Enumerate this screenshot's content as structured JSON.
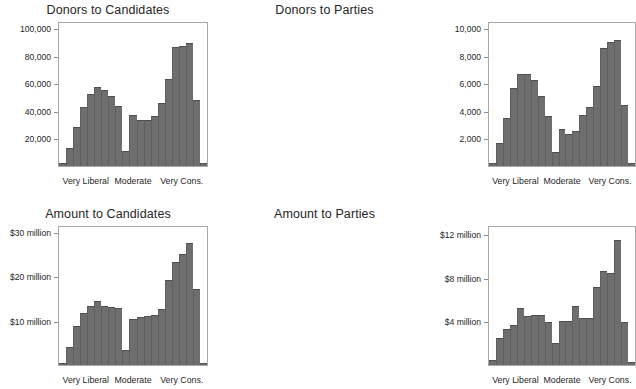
{
  "figure": {
    "panel_count": 4,
    "bar_color": "#6e6e6e",
    "frame_color": "#a8a8a8",
    "background": "#ffffff"
  },
  "x_axis_labels": {
    "left": "Very Liberal",
    "center": "Moderate",
    "right": "Very Cons."
  },
  "chart_data": [
    {
      "id": "donors-to-candidates",
      "type": "bar",
      "title": "Donors to Candidates",
      "xlabel": "",
      "ylabel": "",
      "grid": false,
      "legend": false,
      "ylim": [
        0,
        105000
      ],
      "yticks": [
        20000,
        40000,
        60000,
        80000,
        100000
      ],
      "ytick_labels": [
        "20,000",
        "40,000",
        "60,000",
        "80,000",
        "100,000"
      ],
      "xtick_labels": [
        "Very Liberal",
        "Moderate",
        "Very Cons."
      ],
      "categories": [
        "1",
        "2",
        "3",
        "4",
        "5",
        "6",
        "7",
        "8",
        "9",
        "10",
        "11",
        "12",
        "13",
        "14",
        "15",
        "16",
        "17",
        "18",
        "19",
        "20",
        "21"
      ],
      "values": [
        2000,
        13000,
        28000,
        42500,
        52000,
        57000,
        55000,
        50500,
        43500,
        11000,
        37000,
        33500,
        33500,
        36000,
        45500,
        63000,
        86000,
        87000,
        89000,
        47500,
        2000
      ]
    },
    {
      "id": "donors-to-parties",
      "type": "bar",
      "title": "Donors to Parties",
      "xlabel": "",
      "ylabel": "",
      "grid": false,
      "legend": false,
      "ylim": [
        0,
        10500
      ],
      "yticks": [
        2000,
        4000,
        6000,
        8000,
        10000
      ],
      "ytick_labels": [
        "2,000",
        "4,000",
        "6,000",
        "8,000",
        "10,000"
      ],
      "xtick_labels": [
        "Very Liberal",
        "Moderate",
        "Very Cons."
      ],
      "categories": [
        "1",
        "2",
        "3",
        "4",
        "5",
        "6",
        "7",
        "8",
        "9",
        "10",
        "11",
        "12",
        "13",
        "14",
        "15",
        "16",
        "17",
        "18",
        "19",
        "20",
        "21"
      ],
      "values": [
        250,
        1650,
        3500,
        5650,
        6650,
        6650,
        6250,
        5050,
        3650,
        1000,
        2650,
        2350,
        2500,
        3700,
        4250,
        5800,
        8550,
        8950,
        9100,
        4450,
        250
      ]
    },
    {
      "id": "amount-to-candidates",
      "type": "bar",
      "title": "Amount to Candidates",
      "xlabel": "",
      "ylabel": "",
      "grid": false,
      "legend": false,
      "ylim": [
        0,
        31500
      ],
      "yticks": [
        10000,
        20000,
        30000
      ],
      "ytick_labels": [
        "$10 million",
        "$20 million",
        "$30 million"
      ],
      "xtick_labels": [
        "Very Liberal",
        "Moderate",
        "Very Cons."
      ],
      "categories": [
        "1",
        "2",
        "3",
        "4",
        "5",
        "6",
        "7",
        "8",
        "9",
        "10",
        "11",
        "12",
        "13",
        "14",
        "15",
        "16",
        "17",
        "18",
        "19",
        "20",
        "21"
      ],
      "values": [
        500,
        4000,
        8700,
        11700,
        13200,
        14400,
        13200,
        13000,
        12800,
        3300,
        10400,
        10800,
        11000,
        11200,
        12500,
        19200,
        23100,
        25000,
        27500,
        17200,
        500
      ]
    },
    {
      "id": "amount-to-parties",
      "type": "bar",
      "title": "Amount to Parties",
      "xlabel": "",
      "ylabel": "",
      "grid": false,
      "legend": false,
      "ylim": [
        0,
        12800
      ],
      "yticks": [
        4000,
        8000,
        12000
      ],
      "ytick_labels": [
        "$4 million",
        "$8 million",
        "$12 million"
      ],
      "xtick_labels": [
        "Very Liberal",
        "Moderate",
        "Very Cons."
      ],
      "categories": [
        "1",
        "2",
        "3",
        "4",
        "5",
        "6",
        "7",
        "8",
        "9",
        "10",
        "11",
        "12",
        "13",
        "14",
        "15",
        "16",
        "17",
        "18",
        "19",
        "20",
        "21"
      ],
      "values": [
        450,
        2500,
        3300,
        3700,
        5200,
        4500,
        4550,
        4550,
        3950,
        2000,
        4000,
        4000,
        5400,
        4300,
        4300,
        7100,
        8600,
        8400,
        11400,
        3950,
        300
      ]
    }
  ]
}
